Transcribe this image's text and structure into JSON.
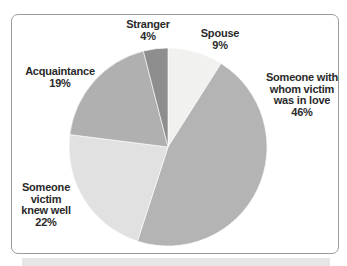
{
  "chart_data": {
    "type": "pie",
    "title": "",
    "start_angle_deg": 0,
    "direction": "clockwise",
    "slices": [
      {
        "label": "Spouse",
        "value": 9,
        "display": "9%",
        "color": "#f1f1ef"
      },
      {
        "label": "Someone with whom victim was in love",
        "value": 46,
        "display": "46%",
        "color": "#b4b4b4"
      },
      {
        "label": "Someone victim knew well",
        "value": 22,
        "display": "22%",
        "color": "#e1e1e1"
      },
      {
        "label": "Acquaintance",
        "value": 19,
        "display": "19%",
        "color": "#b0b0b0"
      },
      {
        "label": "Stranger",
        "value": 4,
        "display": "4%",
        "color": "#8e8e8e"
      }
    ],
    "legend": "none (direct labels)"
  },
  "labels": {
    "spouse": {
      "name": "Spouse",
      "pct": "9%"
    },
    "love": {
      "line1": "Someone with",
      "line2": "whom victim",
      "line3": "was in love",
      "pct": "46%"
    },
    "knew": {
      "line1": "Someone",
      "line2": "victim",
      "line3": "knew well",
      "pct": "22%"
    },
    "acq": {
      "name": "Acquaintance",
      "pct": "19%"
    },
    "stranger": {
      "name": "Stranger",
      "pct": "4%"
    }
  }
}
